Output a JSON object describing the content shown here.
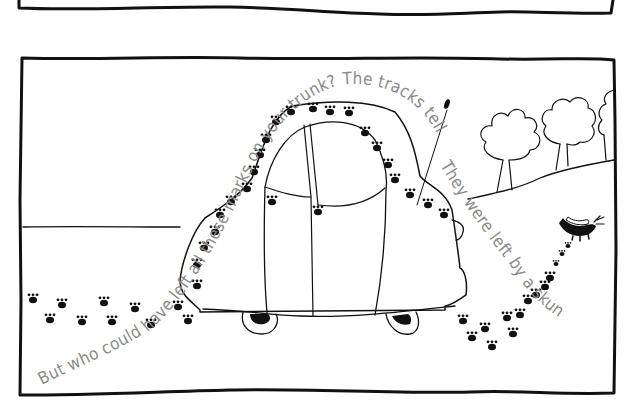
{
  "page": {
    "type": "picture-book-page",
    "panels": [
      {
        "name": "top-panel",
        "content": "empty panel bottom edge (cropped)"
      },
      {
        "name": "illustration-panel",
        "content": "car with paw tracks over its trunk, skunk walking away on a hill with trees"
      }
    ]
  },
  "story": {
    "caption_arc": "But who could have left all these marks on your trunk?  The tracks tell the secret.",
    "caption_tail": "They were left by a skunk."
  },
  "illustration": {
    "ink_color": "#111111",
    "caption_color": "#8a8a8a",
    "background": "#ffffff",
    "subjects": [
      "car-rear-view",
      "paw-tracks",
      "skunk",
      "trees",
      "hill",
      "antenna"
    ]
  }
}
